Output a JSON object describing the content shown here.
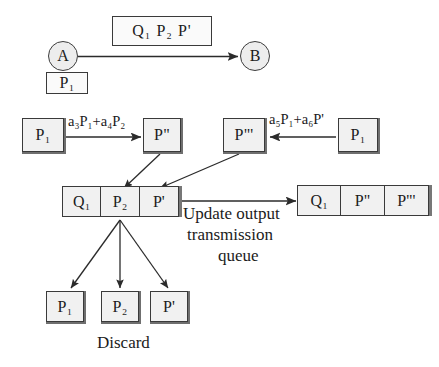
{
  "diagram": {
    "title_nodes": {
      "node_a": "A",
      "node_b": "B"
    },
    "top": {
      "packet_box_items": [
        "Q",
        "P",
        "P'"
      ],
      "packet_box_text": "Q₁  P₂  P'",
      "source_buffer": "P₁"
    },
    "middle": {
      "left_input": "P₁",
      "left_formula": "a₃P₁+a₄P₂",
      "left_output": "P\"",
      "right_output": "P\"'",
      "right_formula": "a₅P₁+a₆P'",
      "right_input": "P₁"
    },
    "input_queue": {
      "cells": [
        "Q₁",
        "P₂",
        "P'"
      ]
    },
    "output_queue": {
      "cells": [
        "Q₁",
        "P\"",
        "P\"'"
      ]
    },
    "annotation": {
      "line1": "Update output",
      "line2": "transmission",
      "line3": "queue"
    },
    "discard": {
      "boxes": [
        "P₁",
        "P₂",
        "P'"
      ],
      "caption": "Discard"
    },
    "colors": {
      "ink": "#1b1b1b",
      "box_fill": "#f1f1f1",
      "box_stroke": "#3a3a3a",
      "node_fill": "#ededed",
      "shadow": "#6f6f6f",
      "background": "#ffffff"
    }
  }
}
